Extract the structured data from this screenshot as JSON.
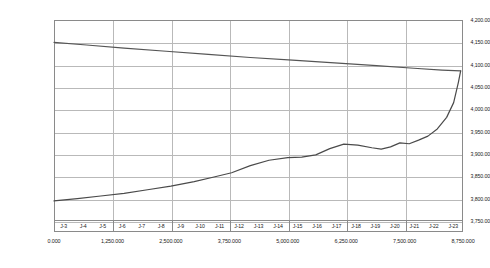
{
  "chart_data": {
    "type": "line",
    "title": "",
    "xlabel": "",
    "ylabel": "",
    "ylim": [
      3750.0,
      4200.0
    ],
    "xlim": [
      0.0,
      8750.0
    ],
    "grid": true,
    "legend": "none",
    "y_ticks": [
      "4,200.00",
      "4,150.00",
      "4,100.00",
      "4,050.00",
      "4,000.00",
      "3,950.00",
      "3,900.00",
      "3,850.00",
      "3,800.00",
      "3,750.00"
    ],
    "y_tick_values": [
      4200.0,
      4150.0,
      4100.0,
      4050.0,
      4000.0,
      3950.0,
      3900.0,
      3850.0,
      3800.0,
      3750.0
    ],
    "x_ticks": [
      "0.000",
      "1,250.000",
      "2,500.000",
      "3,750.000",
      "5,000.000",
      "6,250.000",
      "7,500.000",
      "8,750.000"
    ],
    "x_tick_values": [
      0.0,
      1250.0,
      2500.0,
      3750.0,
      5000.0,
      6250.0,
      7500.0,
      8750.0
    ],
    "x_categories": [
      "J-3",
      "J-4",
      "J-5",
      "J-6",
      "J-7",
      "J-8",
      "J-9",
      "J-10",
      "J-11",
      "J-12",
      "J-13",
      "J-14",
      "J-15",
      "J-16",
      "J-17",
      "J-18",
      "J-19",
      "J-20",
      "J-21",
      "J-22",
      "J-23"
    ],
    "series": [
      {
        "name": "upper",
        "color": "#555555",
        "x": [
          0,
          700,
          1500,
          2400,
          3300,
          4200,
          5100,
          6000,
          6900,
          7700,
          8300,
          8700
        ],
        "values": [
          4150.0,
          4144.0,
          4137.0,
          4130.0,
          4123.0,
          4116.0,
          4110.0,
          4104.0,
          4098.0,
          4092.0,
          4088.0,
          4086.0
        ]
      },
      {
        "name": "lower",
        "color": "#4a4a4a",
        "x": [
          0,
          500,
          1000,
          1500,
          2000,
          2500,
          3000,
          3400,
          3800,
          4200,
          4600,
          5000,
          5300,
          5600,
          5900,
          6200,
          6500,
          6800,
          7000,
          7200,
          7400,
          7600,
          7800,
          8000,
          8200,
          8400,
          8550,
          8650,
          8700
        ],
        "values": [
          3795.0,
          3800.0,
          3806.0,
          3812.0,
          3820.0,
          3828.0,
          3838.0,
          3848.0,
          3858.0,
          3874.0,
          3886.0,
          3892.0,
          3893.0,
          3898.0,
          3912.0,
          3922.0,
          3920.0,
          3914.0,
          3911.0,
          3916.0,
          3925.0,
          3923.0,
          3931.0,
          3940.0,
          3956.0,
          3982.0,
          4015.0,
          4060.0,
          4086.0
        ]
      }
    ]
  }
}
